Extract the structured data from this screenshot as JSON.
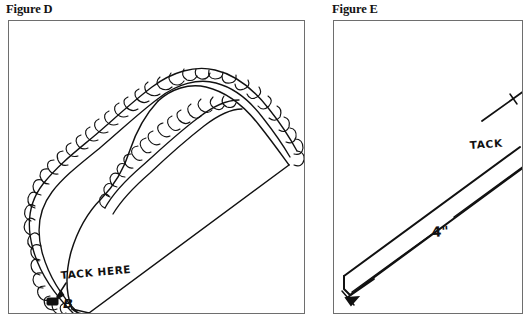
{
  "document": {
    "title": "Figure D and Figure E",
    "background_color": "#ffffff",
    "ink_color": "#111111",
    "frame_color": "#6e6e6e"
  },
  "figures": [
    {
      "id": "figure-d",
      "caption": "Figure D",
      "description": "Line drawing of a folded fabric swag with ruffled trim along its curved edge, pointing down to a tip at the bottom of the frame",
      "annotations": [
        {
          "id": "tack-here-note",
          "text": "TACK HERE",
          "style": "handwritten",
          "points_to": "tack-marker-b"
        },
        {
          "id": "point-label-b",
          "text": "B",
          "style": "handwritten"
        },
        {
          "id": "tack-marker-b",
          "text": "",
          "style": "filled-rectangle-marker"
        }
      ]
    },
    {
      "id": "figure-e",
      "caption": "Figure E",
      "description": "Line drawing of a long narrow folded fabric strip running diagonally, with an arrow at its lower end",
      "annotations": [
        {
          "id": "tack-note",
          "text": "TACK",
          "style": "handwritten",
          "note": "text is cut off at the right edge of the image"
        },
        {
          "id": "width-measure",
          "text": "4\"",
          "style": "handwritten"
        }
      ]
    }
  ]
}
